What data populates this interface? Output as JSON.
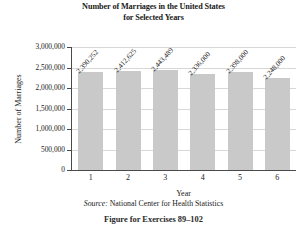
{
  "chart_data": {
    "type": "bar",
    "title": "Number of Marriages in the United States for Selected Years",
    "title_line1": "Number of Marriages in the United States",
    "title_line2": "for Selected Years",
    "xlabel": "Year",
    "ylabel": "Number of Marriages",
    "categories": [
      "1",
      "2",
      "3",
      "4",
      "5",
      "6"
    ],
    "values": [
      2390252,
      2412625,
      2443489,
      2336000,
      2398000,
      2248000
    ],
    "data_labels": [
      "2,390,252",
      "2,412,625",
      "2,443,489",
      "2,336,000",
      "2,398,000",
      "2,248,000"
    ],
    "ylim": [
      0,
      3000000
    ],
    "ytick_values": [
      0,
      500000,
      1000000,
      1500000,
      2000000,
      2500000,
      3000000
    ],
    "ytick_labels": [
      "0",
      "500,000",
      "1,000,000",
      "1,500,000",
      "2,000,000",
      "2,500,000",
      "3,000,000"
    ],
    "grid": true,
    "legend": null,
    "bar_color": "#c9c9c9",
    "axis_color": "#4a4a4a",
    "grid_color": "#d8d8d8"
  },
  "source": {
    "label": "Source:",
    "text": " National Center for Health Statistics"
  },
  "caption": "Figure for Exercises 89–102"
}
